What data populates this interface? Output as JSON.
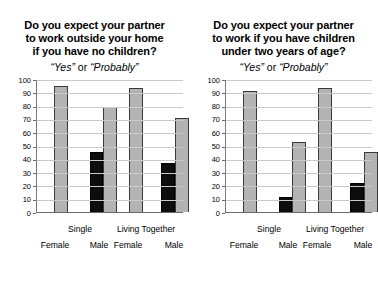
{
  "chart_data": [
    {
      "type": "bar",
      "title": "Do you expect your partner to work outside your home if you have no children?",
      "title_lines": [
        "Do you expect your partner",
        "to work outside your home",
        "if you have no children?"
      ],
      "subtitle": "“Yes” or “Probably”",
      "subtitle_parts": {
        "yes": "“Yes”",
        "or": "or",
        "probably": "“Probably”"
      },
      "xlabel": "",
      "ylabel": "",
      "ylim": [
        0,
        100
      ],
      "ytick_labels": [
        "100",
        "90",
        "80",
        "70",
        "60",
        "50",
        "40",
        "30",
        "20",
        "10",
        "0"
      ],
      "ytick_values": [
        100,
        90,
        80,
        70,
        60,
        50,
        40,
        30,
        20,
        10,
        0
      ],
      "grid": true,
      "legend": "none",
      "groups": [
        "Single",
        "Living Together"
      ],
      "categories": [
        "Female",
        "Male",
        "Female",
        "Male"
      ],
      "bars": [
        {
          "group": "Single",
          "sex": "Female",
          "color": "grey",
          "value": 95
        },
        {
          "group": "Single",
          "sex": "Male",
          "color": "black",
          "value": 45
        },
        {
          "group": "Single",
          "sex": "Male",
          "color": "grey",
          "value": 79
        },
        {
          "group": "Living Together",
          "sex": "Female",
          "color": "grey",
          "value": 93
        },
        {
          "group": "Living Together",
          "sex": "Male",
          "color": "black",
          "value": 37
        },
        {
          "group": "Living Together",
          "sex": "Male",
          "color": "grey",
          "value": 71
        }
      ]
    },
    {
      "type": "bar",
      "title": "Do you expect your partner to work if you have children under two years of age?",
      "title_lines": [
        "Do you expect your partner",
        "to work if you have children",
        "under two years of age?"
      ],
      "subtitle": "“Yes” or “Probably”",
      "subtitle_parts": {
        "yes": "“Yes”",
        "or": "or",
        "probably": "“Probably”"
      },
      "xlabel": "",
      "ylabel": "",
      "ylim": [
        0,
        100
      ],
      "ytick_labels": [
        "100",
        "90",
        "80",
        "70",
        "60",
        "50",
        "40",
        "30",
        "20",
        "10",
        "0"
      ],
      "ytick_values": [
        100,
        90,
        80,
        70,
        60,
        50,
        40,
        30,
        20,
        10,
        0
      ],
      "grid": true,
      "legend": "none",
      "groups": [
        "Single",
        "Living Together"
      ],
      "categories": [
        "Female",
        "Male",
        "Female",
        "Male"
      ],
      "bars": [
        {
          "group": "Single",
          "sex": "Female",
          "color": "grey",
          "value": 91
        },
        {
          "group": "Single",
          "sex": "Male",
          "color": "black",
          "value": 11
        },
        {
          "group": "Single",
          "sex": "Male",
          "color": "grey",
          "value": 53
        },
        {
          "group": "Living Together",
          "sex": "Female",
          "color": "grey",
          "value": 93
        },
        {
          "group": "Living Together",
          "sex": "Male",
          "color": "black",
          "value": 22
        },
        {
          "group": "Living Together",
          "sex": "Male",
          "color": "grey",
          "value": 45
        }
      ]
    }
  ],
  "colors": {
    "bar_grey": "#b3b3b3",
    "bar_black": "#0d0d0d",
    "bar_outline": "#3a3a3a",
    "gridline": "#c9c9c9",
    "axis": "#6b6b6b",
    "background": "#ffffff",
    "text": "#000000"
  }
}
